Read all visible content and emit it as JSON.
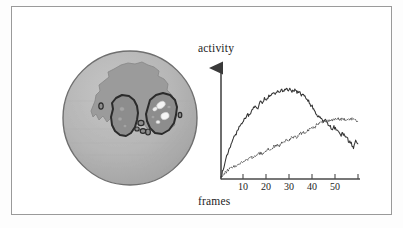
{
  "figure": {
    "caption_text": "",
    "frame_color": "#9a9a9a",
    "background_color": "#ffffff"
  },
  "brain_map": {
    "name": "cortical-activation-map",
    "description": "shaded sphere showing head with two dark outlined activation blobs",
    "sphere_fill": "#b3b3b3",
    "sphere_edge": "#6f6f6f",
    "cortex_region_fill": "#9a9a9a",
    "cortex_region_edge": "#8a8a8a",
    "blob_fill": "#8e8e8e",
    "blob_edge": "#2a2a2a",
    "hotspot_fill": "#f2f2f2",
    "hotspot_edge": "#cfcfcf"
  },
  "chart_data": {
    "type": "line",
    "title": "",
    "xlabel": "frames",
    "ylabel": "activity",
    "xlim": [
      0,
      64
    ],
    "ylim": [
      0,
      100
    ],
    "grid": false,
    "legend": "none",
    "axis_style": "two-axis-with-arrow-on-y",
    "xticks": [
      10,
      20,
      30,
      40,
      50
    ],
    "xtick_labels": [
      "10",
      "20",
      "30",
      "40",
      "50"
    ],
    "yticks": [],
    "ytick_labels": [],
    "series": [
      {
        "name": "upper-curve",
        "style": "solid",
        "color": "#333333",
        "x": [
          0,
          1,
          2,
          3,
          4,
          5,
          6,
          7,
          8,
          9,
          10,
          11,
          12,
          13,
          14,
          15,
          16,
          17,
          18,
          19,
          20,
          21,
          22,
          23,
          24,
          25,
          26,
          27,
          28,
          29,
          30,
          31,
          32,
          33,
          34,
          35,
          36,
          37,
          38,
          39,
          40,
          41,
          42,
          43,
          44,
          45,
          46,
          47,
          48,
          49,
          50,
          51,
          52,
          53,
          54,
          55,
          56,
          57,
          58,
          59,
          60,
          61,
          62,
          63
        ],
        "values": [
          1,
          9,
          17,
          24,
          30,
          35,
          40,
          44,
          48,
          52,
          56,
          58,
          62,
          61,
          66,
          68,
          70,
          69,
          74,
          73,
          78,
          76,
          80,
          79,
          83,
          81,
          85,
          84,
          86,
          83,
          88,
          85,
          87,
          84,
          86,
          83,
          84,
          81,
          82,
          78,
          76,
          72,
          70,
          66,
          63,
          60,
          58,
          55,
          57,
          53,
          51,
          48,
          50,
          47,
          45,
          42,
          44,
          41,
          39,
          36,
          34,
          30,
          37,
          33
        ]
      },
      {
        "name": "lower-curve",
        "style": "dotted",
        "color": "#555555",
        "x": [
          0,
          1,
          2,
          3,
          4,
          5,
          6,
          7,
          8,
          9,
          10,
          11,
          12,
          13,
          14,
          15,
          16,
          17,
          18,
          19,
          20,
          21,
          22,
          23,
          24,
          25,
          26,
          27,
          28,
          29,
          30,
          31,
          32,
          33,
          34,
          35,
          36,
          37,
          38,
          39,
          40,
          41,
          42,
          43,
          44,
          45,
          46,
          47,
          48,
          49,
          50,
          51,
          52,
          53,
          54,
          55,
          56,
          57,
          58,
          59,
          60,
          61,
          62,
          63
        ],
        "values": [
          0,
          3,
          6,
          8,
          10,
          11,
          13,
          12,
          14,
          16,
          17,
          16,
          19,
          20,
          21,
          20,
          23,
          24,
          25,
          24,
          27,
          28,
          29,
          28,
          31,
          32,
          33,
          32,
          35,
          36,
          37,
          36,
          39,
          40,
          41,
          40,
          43,
          44,
          45,
          44,
          47,
          48,
          50,
          49,
          52,
          53,
          55,
          54,
          56,
          55,
          57,
          56,
          58,
          57,
          58,
          57,
          58,
          57,
          58,
          57,
          58,
          57,
          56,
          55
        ]
      }
    ]
  },
  "labels": {
    "activity": "activity",
    "frames": "frames"
  }
}
